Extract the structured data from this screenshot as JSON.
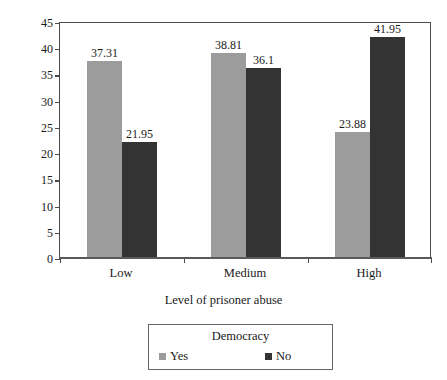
{
  "chart_data": {
    "type": "bar",
    "title": "",
    "xlabel": "Level of prisoner abuse",
    "ylabel": "Percent of captor states",
    "categories": [
      "Low",
      "Medium",
      "High"
    ],
    "series": [
      {
        "name": "Yes",
        "color": "#9c9c9c",
        "values": [
          37.31,
          38.81,
          23.88
        ],
        "labels": [
          "37.31",
          "38.81",
          "23.88"
        ]
      },
      {
        "name": "No",
        "color": "#333333",
        "values": [
          21.95,
          36.1,
          41.95
        ],
        "labels": [
          "21.95",
          "36.1",
          "41.95"
        ]
      }
    ],
    "ylim": [
      0,
      45
    ],
    "ytick_step": 5,
    "yticks": [
      "0",
      "5",
      "10",
      "15",
      "20",
      "25",
      "30",
      "35",
      "40",
      "45"
    ],
    "grid": false,
    "legend": {
      "title": "Democracy",
      "position": "below-plot",
      "entries": [
        {
          "label": "Yes",
          "color": "#9c9c9c"
        },
        {
          "label": "No",
          "color": "#333333"
        }
      ]
    },
    "axis_color": "#4a4a4a",
    "background": "#ffffff"
  }
}
